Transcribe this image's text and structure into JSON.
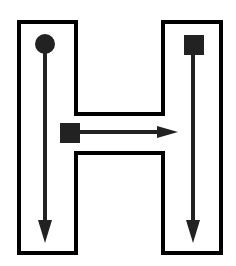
{
  "diagram": {
    "title": "",
    "shape": "letter-H-outline",
    "colors": {
      "background": "#ffffff",
      "outline": "#000000",
      "stroke": "#222222"
    },
    "strokes": [
      {
        "id": 1,
        "start": "circle",
        "direction": "down",
        "location": "left-stem"
      },
      {
        "id": 2,
        "start": "square",
        "direction": "down",
        "location": "right-stem"
      },
      {
        "id": 3,
        "start": "square",
        "direction": "right",
        "location": "crossbar"
      }
    ]
  }
}
